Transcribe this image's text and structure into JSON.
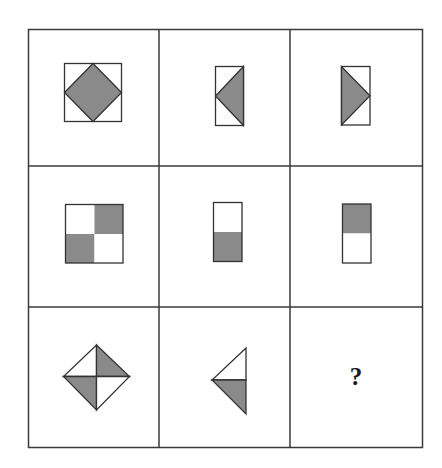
{
  "puzzle": {
    "title": "3x3 figure-reasoning matrix",
    "rows": 3,
    "columns": 3,
    "colors": {
      "line": "#3a3a3a",
      "fill_gray": "#8a8a8a",
      "fill_white": "#ffffff",
      "background": "#ffffff"
    },
    "cells": [
      {
        "row": 1,
        "col": 1,
        "description": "Square containing a gray diamond whose corners touch the square's side midpoints"
      },
      {
        "row": 1,
        "col": 2,
        "description": "Tall rectangle with a gray triangle pointing left (base on right edge)"
      },
      {
        "row": 1,
        "col": 3,
        "description": "Tall rectangle with a gray triangle pointing right (base on left edge)"
      },
      {
        "row": 2,
        "col": 1,
        "description": "Square split into four quarters; top-right and bottom-left gray"
      },
      {
        "row": 2,
        "col": 2,
        "description": "Tall rectangle split horizontally; bottom half gray"
      },
      {
        "row": 2,
        "col": 3,
        "description": "Tall rectangle split horizontally; top half gray"
      },
      {
        "row": 3,
        "col": 1,
        "description": "Diamond split into four triangles; top-right and bottom-left gray"
      },
      {
        "row": 3,
        "col": 2,
        "description": "Left-pointing triangle split horizontally; bottom half gray"
      },
      {
        "row": 3,
        "col": 3,
        "description": "Unknown answer cell",
        "label": "?"
      }
    ],
    "answer_placeholder": "?"
  }
}
